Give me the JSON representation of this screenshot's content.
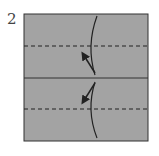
{
  "diagram": {
    "step_number": "2",
    "paper_color": "#a3a3a3",
    "line_color": "#222222",
    "folds": [
      {
        "type": "valley",
        "position": "upper"
      },
      {
        "type": "crease",
        "position": "middle"
      },
      {
        "type": "valley",
        "position": "lower"
      }
    ],
    "arrows": [
      {
        "direction": "up-left",
        "meaning": "fold-to-upper-line"
      },
      {
        "direction": "down-left",
        "meaning": "fold-to-lower-line"
      }
    ]
  }
}
